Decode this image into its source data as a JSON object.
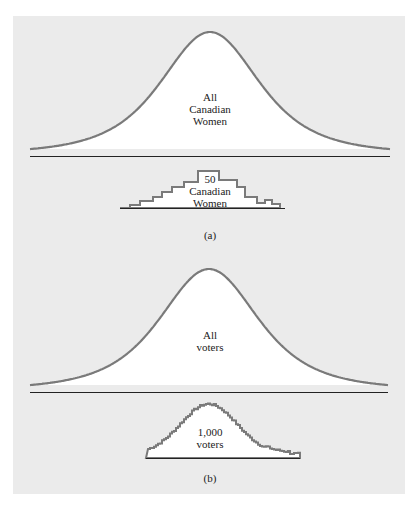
{
  "figure": {
    "panel_a": {
      "population_label": [
        "All",
        "Canadian",
        "Women"
      ],
      "sample_label": [
        "50",
        "Canadian",
        "Women"
      ],
      "caption": "(a)"
    },
    "panel_b": {
      "population_label": [
        "All",
        "voters"
      ],
      "sample_label": [
        "1,000",
        "voters"
      ],
      "caption": "(b)"
    },
    "colors": {
      "background": "#ebebeb",
      "curve_stroke": "#7a7a7a",
      "fill": "#ffffff",
      "baseline": "#222222"
    }
  }
}
